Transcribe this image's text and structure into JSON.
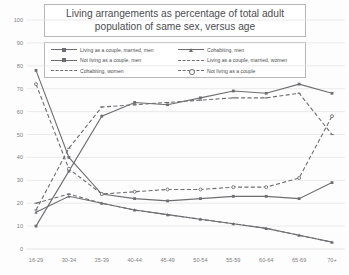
{
  "chart_data": {
    "type": "line",
    "title": "Living arrangements as percentage of total adult population of same sex, versus age",
    "xlabel": "",
    "ylabel": "",
    "ylim": [
      0,
      100
    ],
    "ytick_step": 10,
    "grid": true,
    "legend_position": "top-inside",
    "categories": [
      "16-29",
      "30-34",
      "35-39",
      "40-44",
      "45-49",
      "50-54",
      "55-59",
      "60-64",
      "65-69",
      "70+"
    ],
    "yticks": [
      "0",
      "10",
      "20",
      "30",
      "40",
      "50",
      "60",
      "70",
      "80",
      "90",
      "100"
    ],
    "series": [
      {
        "name": "Living as a couple, married, men",
        "style": "solid",
        "marker": "square",
        "color": "#6e6e72",
        "values": [
          10,
          34,
          58,
          64,
          63,
          66,
          69,
          68,
          72,
          68
        ]
      },
      {
        "name": "Cohabiting, men",
        "style": "solid",
        "marker": "triangle",
        "color": "#6e6e72",
        "values": [
          16,
          23,
          20,
          17,
          15,
          13,
          11,
          9,
          6,
          3
        ]
      },
      {
        "name": "Not living as a couple, men",
        "style": "solid",
        "marker": "square",
        "color": "#6e6e72",
        "values": [
          78,
          40,
          24,
          22,
          21,
          22,
          23,
          23,
          22,
          29
        ]
      },
      {
        "name": "Living as a couple, married, women",
        "style": "dashed",
        "marker": "dash",
        "color": "#6e6e72",
        "values": [
          17,
          44,
          62,
          63,
          64,
          65,
          66,
          66,
          68,
          50
        ]
      },
      {
        "name": "Cohabiting, women",
        "style": "dashed",
        "marker": "dash",
        "color": "#6e6e72",
        "values": [
          20,
          24,
          20,
          17,
          15,
          13,
          11,
          9,
          6,
          3
        ]
      },
      {
        "name": "Not living as a couple",
        "style": "dashed",
        "marker": "circle",
        "color": "#6e6e72",
        "values": [
          72,
          35,
          24,
          25,
          26,
          26,
          27,
          27,
          31,
          58
        ]
      }
    ]
  },
  "axis": {
    "y_min": 0,
    "y_max": 100
  }
}
